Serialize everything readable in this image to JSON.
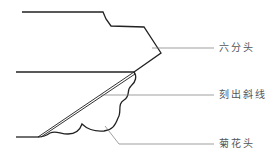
{
  "diagram": {
    "title": "",
    "labels": [
      {
        "id": "liufentou",
        "text": "六分头"
      },
      {
        "id": "kechuxiexian",
        "text": "刻出斜线"
      },
      {
        "id": "juhuatou",
        "text": "菊花头"
      }
    ],
    "colors": {
      "outline": "#222222",
      "leader": "#666666",
      "text": "#555555",
      "background": "#ffffff"
    }
  }
}
